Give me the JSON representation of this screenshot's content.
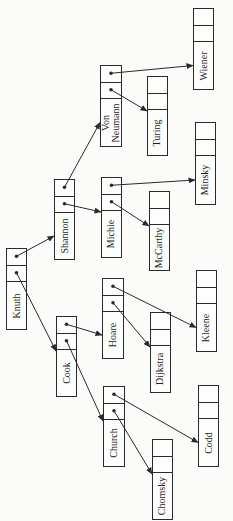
{
  "diagram": {
    "type": "binary-tree-linked-nodes",
    "orientation": "rotated-90-ccw",
    "colors": {
      "stroke": "#2a2a2a",
      "background": "#fbfbfa",
      "text": "#1e1e1e"
    },
    "nodes": [
      {
        "id": "knuth",
        "label": "Knuth",
        "x": 6,
        "y": 248,
        "w": 21,
        "h": 82
      },
      {
        "id": "shannon",
        "label": "Shannon",
        "x": 54,
        "y": 179,
        "w": 21,
        "h": 81
      },
      {
        "id": "cook",
        "label": "Cook",
        "x": 56,
        "y": 316,
        "w": 21,
        "h": 81
      },
      {
        "id": "vonneumann",
        "label": "Von\nNeumann",
        "x": 100,
        "y": 65,
        "w": 22,
        "h": 82
      },
      {
        "id": "michie",
        "label": "Michie",
        "x": 101,
        "y": 177,
        "w": 21,
        "h": 81
      },
      {
        "id": "hoare",
        "label": "Hoare",
        "x": 102,
        "y": 278,
        "w": 22,
        "h": 81
      },
      {
        "id": "church",
        "label": "Church",
        "x": 103,
        "y": 386,
        "w": 22,
        "h": 81
      },
      {
        "id": "turing",
        "label": "Turing",
        "x": 147,
        "y": 76,
        "w": 21,
        "h": 80
      },
      {
        "id": "mccarthy",
        "label": "McCarthy",
        "x": 149,
        "y": 191,
        "w": 21,
        "h": 80
      },
      {
        "id": "dijkstra",
        "label": "Dijkstra",
        "x": 150,
        "y": 312,
        "w": 21,
        "h": 81
      },
      {
        "id": "chomsky",
        "label": "Chomsky",
        "x": 152,
        "y": 439,
        "w": 21,
        "h": 81
      },
      {
        "id": "wiener",
        "label": "Wiener",
        "x": 193,
        "y": 8,
        "w": 21,
        "h": 82
      },
      {
        "id": "minsky",
        "label": "Minsky",
        "x": 195,
        "y": 122,
        "w": 21,
        "h": 83
      },
      {
        "id": "kleene",
        "label": "Kleene",
        "x": 196,
        "y": 270,
        "w": 21,
        "h": 82
      },
      {
        "id": "codd",
        "label": "Codd",
        "x": 198,
        "y": 385,
        "w": 21,
        "h": 82
      }
    ],
    "edges": [
      {
        "from": "knuth",
        "slot": "right",
        "to": "shannon"
      },
      {
        "from": "knuth",
        "slot": "left",
        "to": "cook"
      },
      {
        "from": "shannon",
        "slot": "right",
        "to": "vonneumann"
      },
      {
        "from": "shannon",
        "slot": "left",
        "to": "michie"
      },
      {
        "from": "cook",
        "slot": "right",
        "to": "hoare"
      },
      {
        "from": "cook",
        "slot": "left",
        "to": "church"
      },
      {
        "from": "vonneumann",
        "slot": "right",
        "to": "wiener"
      },
      {
        "from": "vonneumann",
        "slot": "left",
        "to": "turing"
      },
      {
        "from": "michie",
        "slot": "right",
        "to": "minsky"
      },
      {
        "from": "michie",
        "slot": "left",
        "to": "mccarthy"
      },
      {
        "from": "hoare",
        "slot": "right",
        "to": "kleene"
      },
      {
        "from": "hoare",
        "slot": "left",
        "to": "dijkstra"
      },
      {
        "from": "church",
        "slot": "right",
        "to": "codd"
      },
      {
        "from": "church",
        "slot": "left",
        "to": "chomsky"
      }
    ]
  }
}
